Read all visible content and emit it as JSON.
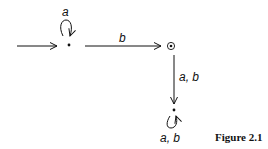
{
  "diagram": {
    "type": "finite-automaton",
    "states": [
      {
        "id": "q0",
        "initial": true,
        "accepting": false,
        "self_loop_label": "a"
      },
      {
        "id": "q1",
        "initial": false,
        "accepting": true
      },
      {
        "id": "q2",
        "initial": false,
        "accepting": false,
        "self_loop_label": "a, b"
      }
    ],
    "transitions": [
      {
        "from": "q0",
        "to": "q1",
        "label": "b"
      },
      {
        "from": "q1",
        "to": "q2",
        "label": "a, b"
      }
    ],
    "labels": {
      "q0_loop": "a",
      "q0_to_q1": "b",
      "q1_to_q2": "a, b",
      "q2_loop": "a, b"
    },
    "caption": "Figure 2.1",
    "colors": {
      "stroke": "#111111",
      "background": "#ffffff"
    }
  }
}
